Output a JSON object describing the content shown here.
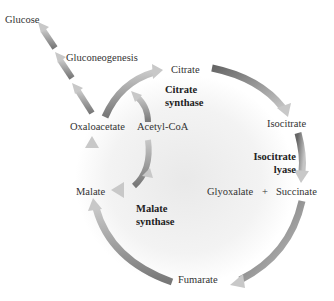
{
  "diagram": {
    "colors": {
      "arrow_dark": "#6b6b6b",
      "arrow_light": "#bdbdbd",
      "arrow_head": "#c8c8c8",
      "text": "#333333",
      "background_glow": "#e6e6e6"
    },
    "metabolites": {
      "glucose": "Glucose",
      "gluconeogenesis": "Gluconeogenesis",
      "citrate": "Citrate",
      "oxaloacetate": "Oxaloacetate",
      "acetyl_coa": "Acetyl-CoA",
      "isocitrate": "Isocitrate",
      "malate": "Malate",
      "glyoxalate": "Glyoxalate",
      "plus": "+",
      "succinate": "Succinate",
      "fumarate": "Fumarate"
    },
    "enzymes": {
      "citrate_synthase_line1": "Citrate",
      "citrate_synthase_line2": "synthase",
      "isocitrate_lyase_line1": "Isocitrate",
      "isocitrate_lyase_line2": "lyase",
      "malate_synthase_line1": "Malate",
      "malate_synthase_line2": "synthase"
    },
    "edges": [
      {
        "from": "Oxaloacetate",
        "to": "Citrate",
        "enzyme": "Citrate synthase"
      },
      {
        "from": "Acetyl-CoA",
        "to": "Citrate",
        "enzyme": "Citrate synthase"
      },
      {
        "from": "Citrate",
        "to": "Isocitrate"
      },
      {
        "from": "Isocitrate",
        "to": "Glyoxalate + Succinate",
        "enzyme": "Isocitrate lyase"
      },
      {
        "from": "Glyoxalate",
        "to": "Malate",
        "enzyme": "Malate synthase"
      },
      {
        "from": "Acetyl-CoA",
        "to": "Malate",
        "enzyme": "Malate synthase"
      },
      {
        "from": "Succinate",
        "to": "Fumarate"
      },
      {
        "from": "Fumarate",
        "to": "Malate"
      },
      {
        "from": "Malate",
        "to": "Oxaloacetate"
      },
      {
        "from": "Oxaloacetate",
        "to": "Glucose",
        "via": "Gluconeogenesis"
      }
    ]
  }
}
